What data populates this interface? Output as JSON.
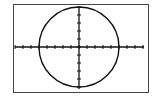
{
  "chart_data": {
    "type": "line",
    "title": "",
    "xlabel": "",
    "ylabel": "",
    "series": [
      {
        "name": "circle",
        "equation": "x^2 + y^2 = 100",
        "radius": 10
      }
    ],
    "xlim": [
      -16,
      16
    ],
    "ylim": [
      -10.5,
      10.5
    ],
    "x_tick_step": 2,
    "y_tick_step": 2,
    "grid": false,
    "legend": "none"
  },
  "colors": {
    "plot": "#111111",
    "frame": "#444444",
    "background": "#ffffff"
  }
}
